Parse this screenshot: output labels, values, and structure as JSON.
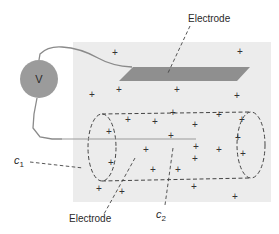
{
  "diagram": {
    "colors": {
      "background": "#ffffff",
      "region": "#ececec",
      "electrode": "#8f8f8f",
      "voltmeter": "#9b9b9b",
      "wire": "#8a8a8a",
      "dashed": "#444444",
      "text": "#2a2a2a"
    },
    "voltmeter": {
      "label": "V"
    },
    "labels": {
      "top_electrode": "Electrode",
      "bottom_electrode": "Electrode",
      "c1": "c",
      "c1_sub": "1",
      "c2": "c",
      "c2_sub": "2"
    },
    "charges": {
      "symbol": "+",
      "positions": [
        [
          115,
          52
        ],
        [
          240,
          51
        ],
        [
          92,
          94
        ],
        [
          119,
          89
        ],
        [
          177,
          89
        ],
        [
          237,
          95
        ],
        [
          128,
          119
        ],
        [
          155,
          121
        ],
        [
          173,
          112
        ],
        [
          195,
          124
        ],
        [
          219,
          114
        ],
        [
          242,
          119
        ],
        [
          109,
          131
        ],
        [
          171,
          135
        ],
        [
          238,
          137
        ],
        [
          146,
          149
        ],
        [
          196,
          146
        ],
        [
          219,
          149
        ],
        [
          243,
          153
        ],
        [
          111,
          162
        ],
        [
          153,
          169
        ],
        [
          178,
          169
        ],
        [
          195,
          158
        ],
        [
          99,
          188
        ],
        [
          122,
          191
        ],
        [
          194,
          186
        ],
        [
          235,
          196
        ]
      ]
    }
  }
}
